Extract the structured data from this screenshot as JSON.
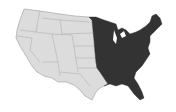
{
  "map": {
    "subject": "Contiguous United States",
    "highlighted_region": "Eastern United States (east of the Great Plains)",
    "colors": {
      "background": "#ffffff",
      "unshaded_fill": "#dcdcdc",
      "shaded_fill": "#333333",
      "border": "#9a9a9a"
    }
  }
}
